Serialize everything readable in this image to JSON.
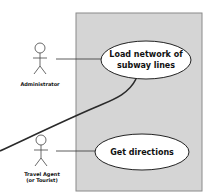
{
  "diagram": {
    "type": "uml-use-case",
    "system_boundary": {
      "fill": "#d5d5d5",
      "stroke": "#8a8a8a"
    },
    "actors": [
      {
        "id": "administrator",
        "label_lines": [
          "Administrator"
        ]
      },
      {
        "id": "travel-agent",
        "label_lines": [
          "Travel Agent",
          "(or Tourist)"
        ]
      }
    ],
    "use_cases": [
      {
        "id": "load-network",
        "label_lines": [
          "Load network of",
          "subway lines"
        ]
      },
      {
        "id": "get-directions",
        "label_lines": [
          "Get directions"
        ]
      }
    ],
    "associations": [
      {
        "from": "administrator",
        "to": "load-network"
      },
      {
        "from": "travel-agent",
        "to": "get-directions"
      }
    ],
    "colors": {
      "line": "#2a2a2a",
      "ellipse_fill": "#ffffff"
    }
  }
}
